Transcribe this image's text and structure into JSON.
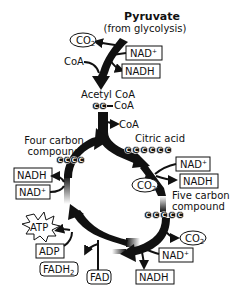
{
  "title": "Pyruvate",
  "subtitle": "(from glycolysis)",
  "pyruvate_step": {
    "co2": "CO",
    "co2_sub": "2",
    "coa_in": "CoA",
    "nad_plus": "NAD",
    "nad_plus_sup": "+",
    "nadh": "NADH"
  },
  "acetyl_coa": {
    "label": "Acetyl CoA",
    "coa_attached": "CoA",
    "carbons": [
      "C",
      "C"
    ]
  },
  "coa_release": "CoA",
  "citric_acid": {
    "label": "Citric acid",
    "carbons": [
      "C",
      "C",
      "C",
      "C",
      "C",
      "C"
    ]
  },
  "step_citric_to_five": {
    "nad_plus": "NAD",
    "nad_plus_sup": "+",
    "nadh": "NADH",
    "co2": "CO",
    "co2_sub": "2"
  },
  "five_carbon": {
    "label_line1": "Five carbon",
    "label_line2": "compound",
    "carbons": [
      "C",
      "C",
      "C",
      "C",
      "C"
    ]
  },
  "step_five_to_four": {
    "co2": "CO",
    "co2_sub": "2",
    "nad_plus": "NAD",
    "nad_plus_sup": "+",
    "nadh": "NADH"
  },
  "step_bottom_left": {
    "fad": "FAD",
    "fadh2": "FADH",
    "fadh2_sub": "2",
    "adp": "ADP",
    "atp": "ATP"
  },
  "step_left": {
    "nad_plus": "NAD",
    "nad_plus_sup": "+",
    "nadh": "NADH"
  },
  "four_carbon": {
    "label_line1": "Four carbon",
    "label_line2": "compound",
    "carbons": [
      "C",
      "C",
      "C",
      "C"
    ]
  }
}
